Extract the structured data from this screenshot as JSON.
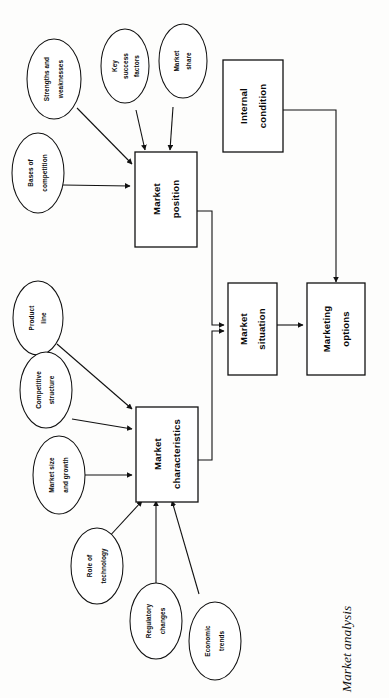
{
  "figure": {
    "caption": "Market analysis",
    "orientation": "rotated-90-ccw",
    "background_color": "#fdfdfc",
    "line_color": "#111111"
  },
  "diagram": {
    "type": "flowchart",
    "boxes": [
      {
        "id": "market-position",
        "line1": "Market",
        "line2": "position"
      },
      {
        "id": "internal-condition",
        "line1": "Internal",
        "line2": "condition"
      },
      {
        "id": "market-situation",
        "line1": "Market",
        "line2": "situation"
      },
      {
        "id": "marketing-options",
        "line1": "Marketing",
        "line2": "options"
      },
      {
        "id": "market-characteristics",
        "line1": "Market",
        "line2": "characteristics"
      }
    ],
    "ellipses": [
      {
        "id": "strengths-and-weaknesses",
        "line1": "Strengths and",
        "line2": "weaknesses",
        "target": "market-position"
      },
      {
        "id": "key-success-factors",
        "line1": "Key",
        "line2": "success",
        "line3": "factors",
        "target": "market-position"
      },
      {
        "id": "market-share",
        "line1": "Market",
        "line2": "share",
        "target": "market-position"
      },
      {
        "id": "bases-of-competition",
        "line1": "Bases of",
        "line2": "competition",
        "target": "market-position"
      },
      {
        "id": "product-line",
        "line1": "Product",
        "line2": "line",
        "target": "market-characteristics"
      },
      {
        "id": "competitive-structure",
        "line1": "Competitive",
        "line2": "structure",
        "target": "market-characteristics"
      },
      {
        "id": "market-size-and-growth",
        "line1": "Market size",
        "line2": "and growth",
        "target": "market-characteristics"
      },
      {
        "id": "role-of-technology",
        "line1": "Role of",
        "line2": "technology",
        "target": "market-characteristics"
      },
      {
        "id": "regulatory-changes",
        "line1": "Regulatory",
        "line2": "changes",
        "target": "market-characteristics"
      },
      {
        "id": "economic-trends",
        "line1": "Economic",
        "line2": "trends",
        "target": "market-characteristics"
      }
    ],
    "flows": [
      {
        "from": "market-position",
        "to": "market-situation"
      },
      {
        "from": "market-characteristics",
        "to": "market-situation"
      },
      {
        "from": "market-situation",
        "to": "marketing-options"
      },
      {
        "from": "internal-condition",
        "to": "marketing-options"
      }
    ]
  }
}
